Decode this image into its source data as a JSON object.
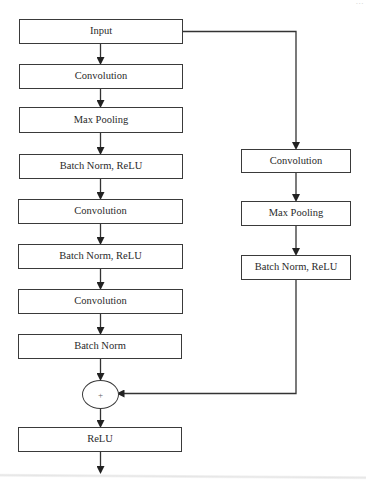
{
  "diagram": {
    "title": "",
    "top_right_fragment": "...",
    "main_branch": [
      {
        "id": "input",
        "label": "Input"
      },
      {
        "id": "conv1",
        "label": "Convolution"
      },
      {
        "id": "maxpool1",
        "label": "Max Pooling"
      },
      {
        "id": "bnrelu1",
        "label": "Batch Norm, ReLU"
      },
      {
        "id": "conv2",
        "label": "Convolution"
      },
      {
        "id": "bnrelu2",
        "label": "Batch Norm, ReLU"
      },
      {
        "id": "conv3",
        "label": "Convolution"
      },
      {
        "id": "bn3",
        "label": "Batch Norm"
      },
      {
        "id": "sum",
        "label": "+"
      },
      {
        "id": "relu_out",
        "label": "ReLU"
      }
    ],
    "shortcut_branch": [
      {
        "id": "sc_conv",
        "label": "Convolution"
      },
      {
        "id": "sc_maxpool",
        "label": "Max Pooling"
      },
      {
        "id": "sc_bnrelu",
        "label": "Batch Norm, ReLU"
      }
    ],
    "edges": [
      [
        "input",
        "conv1"
      ],
      [
        "conv1",
        "maxpool1"
      ],
      [
        "maxpool1",
        "bnrelu1"
      ],
      [
        "bnrelu1",
        "conv2"
      ],
      [
        "conv2",
        "bnrelu2"
      ],
      [
        "bnrelu2",
        "conv3"
      ],
      [
        "conv3",
        "bn3"
      ],
      [
        "bn3",
        "sum"
      ],
      [
        "sum",
        "relu_out"
      ],
      [
        "relu_out",
        "output"
      ],
      [
        "input",
        "sc_conv"
      ],
      [
        "sc_conv",
        "sc_maxpool"
      ],
      [
        "sc_maxpool",
        "sc_bnrelu"
      ],
      [
        "sc_bnrelu",
        "sum"
      ]
    ]
  }
}
